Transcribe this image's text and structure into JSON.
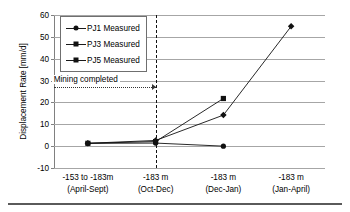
{
  "chart_data": {
    "type": "line",
    "title": "",
    "xlabel": "",
    "ylabel": "Displacement Rate [mm/d]",
    "ylim": [
      -10,
      60
    ],
    "yticks": [
      -10,
      0,
      10,
      20,
      30,
      40,
      50,
      60
    ],
    "ytick_labels": [
      "-10",
      "0",
      "10",
      "20",
      "30",
      "40",
      "50",
      "60"
    ],
    "grid": true,
    "legend_position": "upper left",
    "categories": [
      "-153 to -183m\n(April-Sept)",
      "-183 m\n(Oct-Dec)",
      "-183 m\n(Dec-Jan)",
      "-183 m\n(Jan-April)"
    ],
    "category_lines": [
      {
        "line1": "-153 to -183m",
        "line2": "(April-Sept)"
      },
      {
        "line1": "-183 m",
        "line2": "(Oct-Dec)"
      },
      {
        "line1": "-183 m",
        "line2": "(Dec-Jan)"
      },
      {
        "line1": "-183 m",
        "line2": "(Jan-April)"
      }
    ],
    "series": [
      {
        "name": "PJ1 Measured",
        "marker": "circle",
        "color": "#111111",
        "values": [
          1.3,
          1.4,
          0.0,
          null
        ]
      },
      {
        "name": "PJ3 Measured",
        "marker": "diamond",
        "color": "#111111",
        "values": [
          1.3,
          2.6,
          14.2,
          54.8
        ]
      },
      {
        "name": "PJ5 Measured",
        "marker": "square",
        "color": "#111111",
        "values": [
          1.3,
          2.1,
          21.8,
          null
        ]
      }
    ],
    "annotations": [
      {
        "text": "Mining completed",
        "type": "vertical-line-with-leader",
        "at_category_index": 1,
        "leader_y": 27.0,
        "line_style": "dashed"
      }
    ]
  },
  "legend": {
    "items": [
      {
        "label": "PJ1 Measured",
        "marker": "circle"
      },
      {
        "label": "PJ3 Measured",
        "marker": "diamond"
      },
      {
        "label": "PJ5 Measured",
        "marker": "square"
      }
    ]
  },
  "colors": {
    "series": "#111111",
    "gridline": "#a6a6a6",
    "axis": "#808080",
    "event_line": "#111111",
    "background": "#ffffff"
  }
}
